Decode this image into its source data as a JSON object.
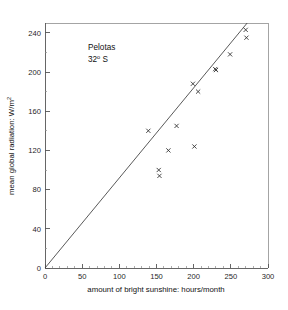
{
  "chart_data": {
    "type": "scatter",
    "title": "",
    "subtitle": "",
    "xlabel": "amount of bright sunshine: hours/month",
    "ylabel": "mean global radiation: W/m",
    "ylabel_exponent": "2",
    "xlim": [
      0,
      300
    ],
    "ylim": [
      0,
      250
    ],
    "xticks": [
      0,
      50,
      100,
      150,
      200,
      250,
      300
    ],
    "xtick_labels": [
      "0",
      "50",
      "100",
      "150",
      "200",
      "250",
      "300"
    ],
    "xtick_minor_step": 10,
    "yticks": [
      0,
      40,
      80,
      120,
      160,
      200,
      240
    ],
    "ytick_labels": [
      "0",
      "40",
      "80",
      "120",
      "160",
      "200",
      "240"
    ],
    "ytick_minor_step": 20,
    "grid": false,
    "legend": null,
    "marker_style": "x",
    "series": [
      {
        "name": "Pelotas monthly means",
        "x": [
          139,
          153,
          154,
          166,
          177,
          199,
          201,
          206,
          229,
          230,
          249,
          270,
          271
        ],
        "y": [
          140,
          100,
          94,
          120,
          145,
          188,
          124,
          180,
          203,
          202,
          218,
          243,
          235
        ]
      }
    ],
    "fit_line": {
      "type": "line",
      "description": "regression line through origin",
      "x": [
        0,
        272
      ],
      "y": [
        0,
        250
      ],
      "slope": 0.92,
      "intercept": 0
    },
    "annotations": [
      {
        "name": "station-name",
        "text": "Pelotas",
        "x": 78,
        "y": 232
      },
      {
        "name": "station-latitude",
        "text": "32",
        "degree": "o",
        "suffix": " S",
        "x": 78,
        "y": 216
      }
    ]
  },
  "figure": {
    "background_color": "#ffffff",
    "axis_color": "#555555",
    "marker_color": "#2a2a2a",
    "line_color": "#3b3b3b"
  }
}
